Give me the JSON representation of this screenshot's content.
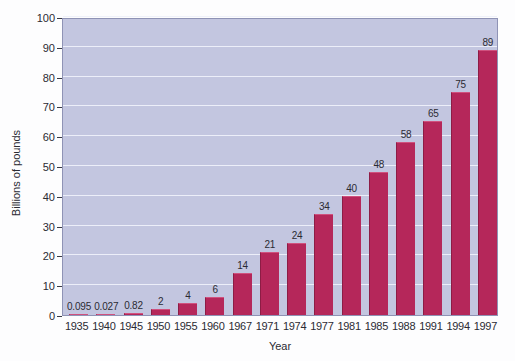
{
  "chart_data": {
    "type": "bar",
    "title": "",
    "xlabel": "Year",
    "ylabel": "Billions of pounds",
    "categories": [
      "1935",
      "1940",
      "1945",
      "1950",
      "1955",
      "1960",
      "1967",
      "1971",
      "1974",
      "1977",
      "1981",
      "1985",
      "1988",
      "1991",
      "1994",
      "1997"
    ],
    "values": [
      0.095,
      0.027,
      0.82,
      2,
      4,
      6,
      14,
      21,
      24,
      34,
      40,
      48,
      58,
      65,
      75,
      89
    ],
    "value_labels": [
      "0.095",
      "0.027",
      "0.82",
      "2",
      "4",
      "6",
      "14",
      "21",
      "24",
      "34",
      "40",
      "48",
      "58",
      "65",
      "75",
      "89"
    ],
    "ylim": [
      0,
      100
    ],
    "ytick_values": [
      0,
      10,
      20,
      30,
      40,
      50,
      60,
      70,
      80,
      90,
      100
    ],
    "ytick_labels": [
      "0",
      "10",
      "20",
      "30",
      "40",
      "50",
      "60",
      "70",
      "80",
      "90",
      "100"
    ],
    "grid": true,
    "legend": "none",
    "bar_color": "#b5275a",
    "plot_background": "#c3c6e0",
    "gridline_color": "#eef0fa",
    "page_background": "#fdfdfe"
  }
}
